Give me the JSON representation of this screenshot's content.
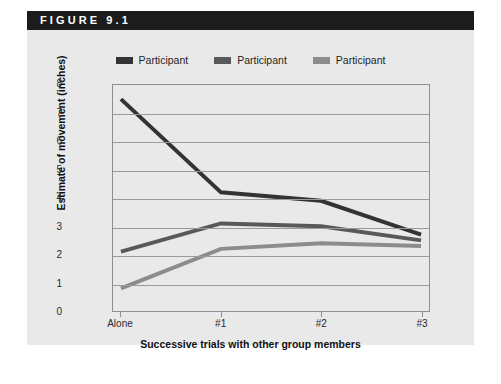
{
  "figure": {
    "header_label": "FIGURE 9.1",
    "panel_color": "#e9e9e9",
    "header_color": "#1c1c1c"
  },
  "legend": {
    "position": "top-center",
    "items": [
      {
        "label": "Participant",
        "color": "#333333"
      },
      {
        "label": "Participant",
        "color": "#595959"
      },
      {
        "label": "Participant",
        "color": "#8c8c8c"
      }
    ]
  },
  "chart_data": {
    "type": "line",
    "title": "FIGURE 9.1",
    "xlabel": "Successive trials with other group members",
    "ylabel": "Estimate of movement (inches)",
    "categories": [
      "Alone",
      "#1",
      "#2",
      "#3"
    ],
    "x": [
      0,
      1,
      2,
      3
    ],
    "ylim": [
      0,
      8
    ],
    "yticks": [
      0,
      1,
      2,
      3,
      4,
      5,
      6,
      7,
      8
    ],
    "grid": true,
    "legend_position": "top-center",
    "series": [
      {
        "name": "Participant",
        "color": "#333333",
        "values": [
          7.5,
          4.2,
          3.9,
          2.7
        ]
      },
      {
        "name": "Participant",
        "color": "#595959",
        "values": [
          2.1,
          3.1,
          3.0,
          2.5
        ]
      },
      {
        "name": "Participant",
        "color": "#8c8c8c",
        "values": [
          0.8,
          2.2,
          2.4,
          2.3
        ]
      }
    ]
  }
}
